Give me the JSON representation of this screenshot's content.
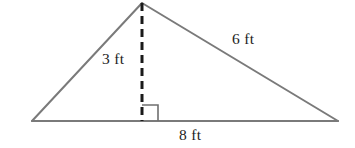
{
  "figure": {
    "type": "geometry-diagram",
    "shape": "triangle",
    "background_color": "#ffffff",
    "canvas": {
      "width": 355,
      "height": 148
    }
  },
  "style": {
    "side_color": "#7a7a7a",
    "side_stroke_width": 2,
    "altitude_color": "#1a1a1a",
    "altitude_stroke_width": 3,
    "altitude_dash_pattern": "8 5",
    "right_angle_color": "#6f6f6f",
    "right_angle_stroke_width": 1.6,
    "label_color": "#222222"
  },
  "vertices": {
    "left": {
      "x": 32,
      "y": 121
    },
    "apex": {
      "x": 142,
      "y": 3
    },
    "right": {
      "x": 338,
      "y": 121
    },
    "foot": {
      "x": 142,
      "y": 121
    }
  },
  "right_angle_marker": {
    "x": 142,
    "y": 104,
    "size": 16
  },
  "labels": {
    "height": "3 ft",
    "hypotenuse": "6 ft",
    "base": "8 ft"
  },
  "measurements": [
    {
      "name": "height",
      "value": 3,
      "unit": "ft",
      "text": "3 ft"
    },
    {
      "name": "right-side",
      "value": 6,
      "unit": "ft",
      "text": "6 ft"
    },
    {
      "name": "base",
      "value": 8,
      "unit": "ft",
      "text": "8 ft"
    }
  ]
}
